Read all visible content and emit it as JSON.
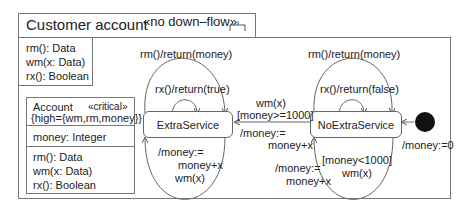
{
  "component": {
    "title": "Customer account",
    "stereotype": "«no down–flow»",
    "operations": [
      "rm(): Data",
      "wm(x: Data)",
      "rx(): Boolean"
    ]
  },
  "account_class": {
    "name": "Account",
    "stereotype": "«critical»",
    "tagged_value": "{high={wm,rm,money}}",
    "attributes": [
      "money: Integer"
    ],
    "operations": [
      "rm(): Data",
      "wm(x: Data)",
      "rx(): Boolean"
    ]
  },
  "states": {
    "extra": "ExtraService",
    "noextra": "NoExtraService"
  },
  "transitions": {
    "extra_rm": "rm()/return(money)",
    "extra_rx": "rx()/return(true)",
    "extra_wm_1": "/money:=",
    "extra_wm_2": "money+x",
    "extra_wm_3": "wm(x)",
    "noextra_rm": "rm()/return(money)",
    "noextra_rx": "rx()/return(false)",
    "to_extra_1": "wm(x)",
    "to_extra_2": "[money>=1000]",
    "to_extra_3": "/money:=",
    "to_extra_4": "money+x",
    "noextra_wm_1": "[money<1000]",
    "noextra_wm_2": "wm(x)",
    "noextra_wm_3": "/money:=",
    "noextra_wm_4": "money+x",
    "initial": "/money:=0"
  }
}
